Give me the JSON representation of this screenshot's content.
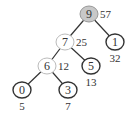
{
  "nodes": [
    {
      "id": "n9",
      "label": "9",
      "weight": "57",
      "style": "root",
      "weight_pos": "right"
    },
    {
      "id": "n7",
      "label": "7",
      "weight": "25",
      "style": "internal",
      "weight_pos": "right"
    },
    {
      "id": "n1",
      "label": "1",
      "weight": "32",
      "style": "leaf",
      "weight_pos": "below"
    },
    {
      "id": "n6",
      "label": "6",
      "weight": "12",
      "style": "internal",
      "weight_pos": "right"
    },
    {
      "id": "n5",
      "label": "5",
      "weight": "13",
      "style": "leaf",
      "weight_pos": "below"
    },
    {
      "id": "n0",
      "label": "0",
      "weight": "5",
      "style": "leaf",
      "weight_pos": "below"
    },
    {
      "id": "n3",
      "label": "3",
      "weight": "7",
      "style": "leaf",
      "weight_pos": "below"
    }
  ],
  "edges": [
    {
      "from": "n9",
      "to": "n7"
    },
    {
      "from": "n9",
      "to": "n1"
    },
    {
      "from": "n7",
      "to": "n6"
    },
    {
      "from": "n7",
      "to": "n5"
    },
    {
      "from": "n6",
      "to": "n0"
    },
    {
      "from": "n6",
      "to": "n3"
    }
  ],
  "colors": {
    "root_fill": "#c8c8c8",
    "internal_stroke": "#bbbbbb",
    "leaf_stroke": "#333333",
    "edge": "#333333"
  }
}
